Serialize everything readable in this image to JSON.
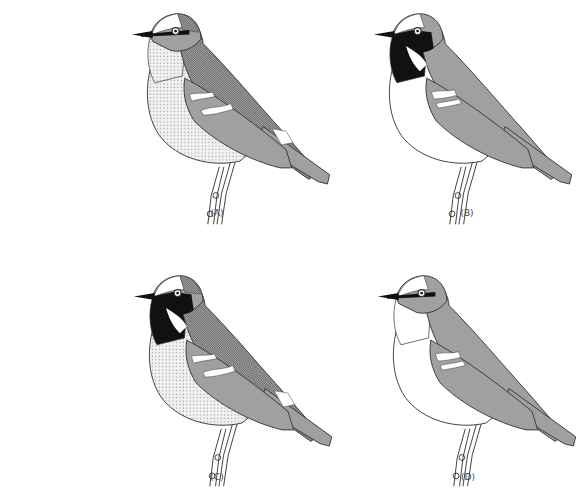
{
  "figure": {
    "panels": [
      {
        "id": "A",
        "label": "(A)",
        "crown": "stipple",
        "mask": "eyeline",
        "throat": "stipple-light",
        "belly": "stipple-light",
        "back": "stipple-dark",
        "wing_patch": true
      },
      {
        "id": "B",
        "label": "(B)",
        "crown": "white",
        "mask": "black",
        "throat": "black",
        "belly": "white",
        "back": "gray",
        "wing_patch": false
      },
      {
        "id": "C",
        "label": "(C)",
        "crown": "stipple",
        "mask": "black",
        "throat": "black",
        "belly": "stipple-light",
        "back": "stipple-dark",
        "wing_patch": true
      },
      {
        "id": "D",
        "label": "(D)",
        "crown": "white",
        "mask": "eyeline",
        "throat": "white",
        "belly": "white",
        "back": "gray",
        "wing_patch": false
      }
    ],
    "colors": {
      "outline": "#333333",
      "gray": "#a0a0a0",
      "black": "#111111",
      "white": "#ffffff",
      "stipple_light": "#e4e4e4",
      "stipple_dark": "#8c8c8c"
    }
  }
}
